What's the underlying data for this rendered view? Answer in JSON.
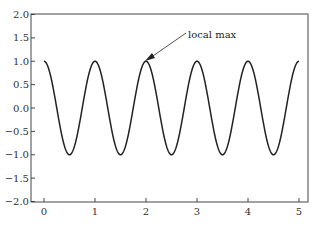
{
  "chart_data": {
    "type": "line",
    "title": "",
    "xlabel": "",
    "ylabel": "",
    "xlim": [
      -0.2,
      5.2
    ],
    "ylim": [
      -2.0,
      2.0
    ],
    "grid": false,
    "legend": null,
    "x_ticks": [
      "0",
      "1",
      "2",
      "3",
      "4",
      "5"
    ],
    "y_ticks": [
      "2.0",
      "1.5",
      "1.0",
      "0.5",
      "0.0",
      "-0.5",
      "-1.0",
      "-1.5",
      "-2.0"
    ],
    "series": [
      {
        "name": "cos(2*pi*t)",
        "function": "cos(2*pi*t)",
        "t_range": [
          0,
          5
        ],
        "x": [
          0,
          0.5,
          1,
          1.5,
          2,
          2.5,
          3,
          3.5,
          4,
          4.5,
          5
        ],
        "values": [
          1,
          -1,
          1,
          -1,
          1,
          -1,
          1,
          -1,
          1,
          -1,
          1
        ],
        "color": "#222222"
      }
    ],
    "annotations": [
      {
        "text": "local max",
        "xy": [
          2,
          1
        ],
        "xytext": [
          3,
          1.5
        ],
        "arrow": true
      }
    ]
  },
  "annotation": {
    "label": "local max"
  },
  "axes": {
    "x_tick_labels": [
      "0",
      "1",
      "2",
      "3",
      "4",
      "5"
    ],
    "y_tick_labels": [
      "2.0",
      "1.5",
      "1.0",
      "0.5",
      "0.0",
      "−0.5",
      "−1.0",
      "−1.5",
      "−2.0"
    ]
  }
}
